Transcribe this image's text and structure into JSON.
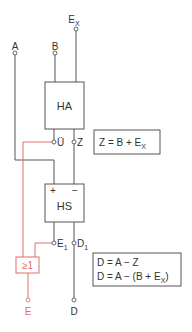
{
  "diagram": {
    "inputs": {
      "a": "A",
      "b": "B",
      "ex_main": "E",
      "ex_sub": "X"
    },
    "blocks": {
      "half_adder": "HA",
      "half_subtractor": "HS",
      "hs_plus": "+",
      "hs_minus": "−",
      "or_gate": "≥1"
    },
    "signals": {
      "carry": "Ü",
      "sum": "Z",
      "e1_main": "E",
      "e1_sub": "1",
      "d1_main": "D",
      "d1_sub": "1"
    },
    "outputs": {
      "e": "E",
      "d": "D"
    },
    "formulas": {
      "z_eq_prefix": "Z = B + E",
      "z_eq_sub": "X",
      "d_eq_line1": "D = A − Z",
      "d_eq_line2_prefix": "D = A − (B + E",
      "d_eq_line2_sub": "X",
      "d_eq_line2_suffix": ")"
    },
    "colors": {
      "wire": "#555555",
      "highlight": "#e0706a"
    }
  }
}
